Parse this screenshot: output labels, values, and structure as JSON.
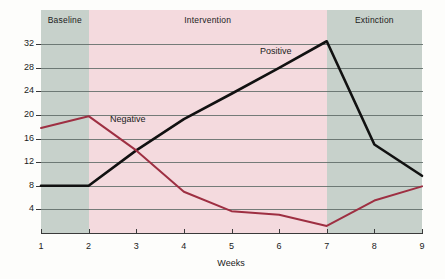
{
  "chart_data": {
    "type": "line",
    "title": "",
    "xlabel": "Weeks",
    "ylabel": "",
    "x": [
      1,
      2,
      3,
      4,
      5,
      6,
      7,
      8,
      9
    ],
    "xticklabels": [
      "1",
      "2",
      "3",
      "4",
      "5",
      "6",
      "7",
      "8",
      "9"
    ],
    "yticklabels": [
      "4",
      "8",
      "12",
      "16",
      "20",
      "24",
      "28",
      "32"
    ],
    "yticks": [
      4,
      8,
      12,
      16,
      20,
      24,
      28,
      32
    ],
    "xlim": [
      1,
      9
    ],
    "ylim": [
      0,
      33.5
    ],
    "grid": "horizontal",
    "legend": "inline-labels",
    "series": [
      {
        "name": "Positive",
        "color": "#111111",
        "values": [
          8.0,
          8.0,
          14.0,
          19.3,
          23.6,
          28.0,
          32.5,
          15.0,
          9.7
        ]
      },
      {
        "name": "Negative",
        "color": "#9e2f42",
        "values": [
          17.8,
          19.8,
          14.0,
          7.0,
          3.7,
          3.1,
          1.2,
          5.5,
          7.9
        ]
      }
    ],
    "phases": [
      {
        "label": "Baseline",
        "start": 1,
        "end": 2,
        "color": "#c7d1cb"
      },
      {
        "label": "Intervention",
        "start": 2,
        "end": 7,
        "color": "#f4dade"
      },
      {
        "label": "Extinction",
        "start": 7,
        "end": 9,
        "color": "#c7d1cb"
      }
    ],
    "annotations": [
      {
        "text": "Positive",
        "x": 5.6,
        "y": 30.6
      },
      {
        "text": "Negative",
        "x": 2.45,
        "y": 19.2
      }
    ]
  }
}
